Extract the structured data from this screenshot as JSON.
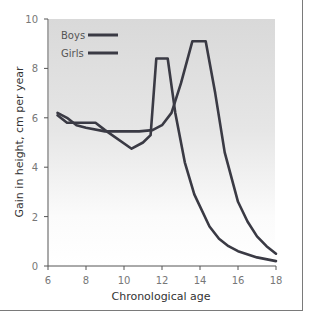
{
  "caption_fragment": "",
  "chart_data": {
    "type": "line",
    "title": "",
    "xlabel": "Chronological age",
    "ylabel": "Gain in height, cm per year",
    "xlim": [
      6,
      18
    ],
    "ylim": [
      0,
      10
    ],
    "xticks": [
      6,
      8,
      10,
      12,
      14,
      16,
      18
    ],
    "yticks": [
      0,
      2,
      4,
      6,
      8,
      10
    ],
    "grid": false,
    "legend_position": "upper-left",
    "background": "gradient-gray-to-white",
    "series": [
      {
        "name": "Boys",
        "color": "#3a3a44",
        "x": [
          6.5,
          7.0,
          7.5,
          8.0,
          9.0,
          10.0,
          10.8,
          11.5,
          12.0,
          12.5,
          13.0,
          13.6,
          14.3,
          14.8,
          15.3,
          16.0,
          16.5,
          17.0,
          17.5,
          18.0
        ],
        "y": [
          6.2,
          6.0,
          5.7,
          5.6,
          5.45,
          5.45,
          5.45,
          5.5,
          5.7,
          6.2,
          7.4,
          9.1,
          9.1,
          7.0,
          4.6,
          2.6,
          1.8,
          1.2,
          0.8,
          0.5
        ]
      },
      {
        "name": "Girls",
        "color": "#3a3a44",
        "x": [
          6.5,
          7.0,
          7.5,
          8.0,
          8.5,
          9.0,
          10.4,
          11.0,
          11.4,
          11.7,
          12.3,
          12.7,
          13.2,
          13.7,
          14.5,
          15.0,
          15.5,
          16.0,
          17.0,
          18.0
        ],
        "y": [
          6.1,
          5.8,
          5.8,
          5.8,
          5.8,
          5.5,
          4.75,
          5.0,
          5.3,
          8.4,
          8.4,
          6.2,
          4.2,
          2.9,
          1.6,
          1.1,
          0.8,
          0.6,
          0.35,
          0.2
        ]
      }
    ]
  }
}
